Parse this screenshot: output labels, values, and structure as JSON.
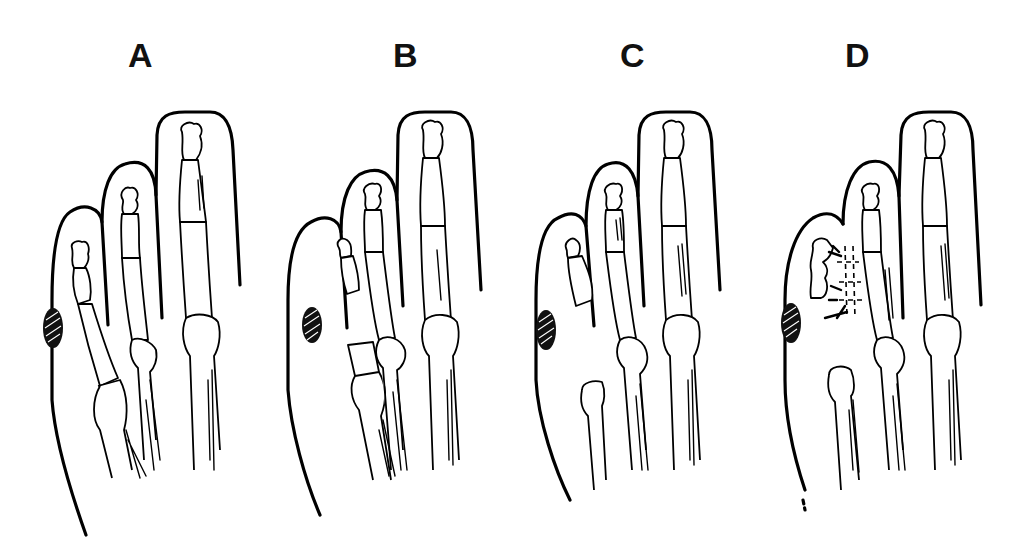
{
  "figure": {
    "type": "medical-line-illustration",
    "background": "#ffffff",
    "ink": "#000000"
  },
  "panels": [
    {
      "id": "A",
      "label": "A",
      "description": "Intact fifth toe with phalanges and metatarsal head; hatched lesion on lateral border"
    },
    {
      "id": "B",
      "label": "B",
      "description": "Metatarsal head resected; phalanges isolated in fifth toe; hatched lesion"
    },
    {
      "id": "C",
      "label": "C",
      "description": "Further resection of fifth metatarsal; phalanges remaining; hatched lesion"
    },
    {
      "id": "D",
      "label": "D",
      "description": "Fifth toe syndactylized to fourth toe with sutures (dashed lines); hatched lesion"
    }
  ],
  "legend": {
    "hatched_oval": "lesion"
  }
}
